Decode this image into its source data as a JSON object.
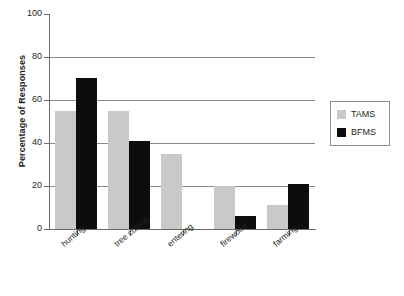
{
  "chart_data": {
    "type": "bar",
    "title": "",
    "subtitle": "",
    "xlabel": "",
    "ylabel": "Percentage of Responses",
    "categories": [
      "hunting",
      "tree cutting",
      "entering",
      "firewood",
      "farming"
    ],
    "series": [
      {
        "name": "TAMS",
        "color": "#c9c9c9",
        "values": [
          55,
          55,
          35,
          20,
          11
        ]
      },
      {
        "name": "BFMS",
        "color": "#0d0d0d",
        "values": [
          70,
          41,
          0,
          6,
          21
        ]
      }
    ],
    "ylim": [
      0,
      100
    ],
    "y_ticks": [
      0,
      20,
      40,
      60,
      80,
      100
    ],
    "y_tick_labels": [
      "0",
      "20",
      "40",
      "60",
      "80",
      "100"
    ],
    "gridlines": [
      20,
      40,
      60,
      80
    ],
    "grid": true,
    "legend_position": "right",
    "legend_entries": [
      "TAMS",
      "BFMS"
    ]
  },
  "axes": {
    "y_title": "Percentage of Responses",
    "y_labels": [
      "100",
      "80",
      "60",
      "40",
      "20",
      "0"
    ],
    "x_labels": [
      "hunting",
      "tree cutting",
      "entering",
      "firewood",
      "farming"
    ]
  },
  "legend": {
    "items": [
      {
        "label": "TAMS",
        "color": "#c9c9c9"
      },
      {
        "label": "BFMS",
        "color": "#0d0d0d"
      }
    ]
  },
  "colors": {
    "tams": "#c9c9c9",
    "bfms": "#0d0d0d",
    "axis": "#6a6a6a",
    "grid": "#8a8a8a",
    "text": "#231f20",
    "background": "#ffffff"
  }
}
